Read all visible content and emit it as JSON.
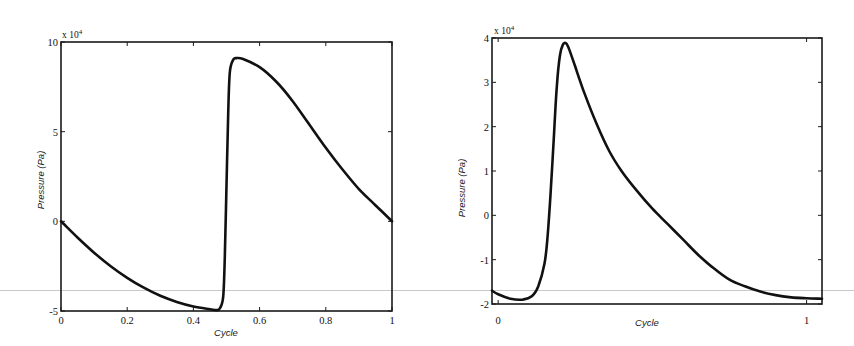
{
  "chart_data": [
    {
      "type": "line",
      "title": "",
      "xlabel": "Cycle",
      "ylabel": "Pressure (Pa)",
      "y_multiplier": "x 10^4",
      "xlim": [
        0,
        1
      ],
      "ylim": [
        -5,
        10
      ],
      "xticks": [
        0,
        0.2,
        0.4,
        0.6,
        0.8,
        1
      ],
      "xtick_labels": [
        "0",
        "0.2",
        "0.4",
        "0.6",
        "0.8",
        "1"
      ],
      "yticks": [
        -5,
        0,
        5,
        10
      ],
      "ytick_labels": [
        "-5",
        "0",
        "5",
        "10"
      ],
      "grid": false,
      "legend": null,
      "series": [
        {
          "name": "pressure",
          "x": [
            0,
            0.05,
            0.1,
            0.15,
            0.2,
            0.25,
            0.3,
            0.35,
            0.4,
            0.45,
            0.47,
            0.48,
            0.49,
            0.495,
            0.5,
            0.505,
            0.51,
            0.52,
            0.53,
            0.55,
            0.6,
            0.65,
            0.7,
            0.75,
            0.8,
            0.85,
            0.9,
            0.95,
            1.0
          ],
          "y": [
            0,
            -0.9,
            -1.75,
            -2.5,
            -3.15,
            -3.7,
            -4.15,
            -4.5,
            -4.75,
            -4.9,
            -4.95,
            -4.85,
            -4.2,
            -2.0,
            2.0,
            6.0,
            8.3,
            9.0,
            9.1,
            9.05,
            8.6,
            7.8,
            6.7,
            5.4,
            4.1,
            2.9,
            1.8,
            0.9,
            0.0
          ]
        }
      ]
    },
    {
      "type": "line",
      "title": "",
      "xlabel": "Cycle",
      "ylabel": "Pressure (Pa)",
      "y_multiplier": "x 10^4",
      "xlim": [
        -0.02,
        1.05
      ],
      "ylim": [
        -2,
        4
      ],
      "xticks": [
        0,
        1
      ],
      "xtick_labels": [
        "0",
        "1"
      ],
      "yticks": [
        -2,
        -1,
        0,
        1,
        2,
        3,
        4
      ],
      "ytick_labels": [
        "-2",
        "-1",
        "0",
        "1",
        "2",
        "3",
        "4"
      ],
      "grid": false,
      "legend": null,
      "series": [
        {
          "name": "pressure",
          "x": [
            -0.02,
            0.0,
            0.04,
            0.08,
            0.11,
            0.13,
            0.15,
            0.16,
            0.17,
            0.18,
            0.19,
            0.2,
            0.21,
            0.22,
            0.23,
            0.25,
            0.28,
            0.32,
            0.36,
            0.4,
            0.45,
            0.5,
            0.55,
            0.6,
            0.65,
            0.7,
            0.75,
            0.8,
            0.85,
            0.9,
            0.95,
            1.0,
            1.05
          ],
          "y": [
            -1.7,
            -1.78,
            -1.88,
            -1.9,
            -1.82,
            -1.6,
            -1.1,
            -0.5,
            0.5,
            1.7,
            2.9,
            3.6,
            3.85,
            3.88,
            3.75,
            3.35,
            2.75,
            2.05,
            1.45,
            1.0,
            0.55,
            0.15,
            -0.2,
            -0.55,
            -0.9,
            -1.2,
            -1.45,
            -1.6,
            -1.72,
            -1.8,
            -1.85,
            -1.87,
            -1.88
          ]
        }
      ]
    }
  ],
  "charts": {
    "left": {
      "exponent_label": "x 10",
      "exponent_power": "4",
      "xlabel": "Cycle",
      "ylabel": "Pressure (Pa)",
      "xtick_labels": [
        "0",
        "0.2",
        "0.4",
        "0.6",
        "0.8",
        "1"
      ],
      "ytick_labels": [
        "-5",
        "0",
        "5",
        "10"
      ]
    },
    "right": {
      "exponent_label": "x 10",
      "exponent_power": "4",
      "xlabel": "Cycle",
      "ylabel": "Pressure (Pa)",
      "xtick_labels": [
        "0",
        "1"
      ],
      "ytick_labels": [
        "-2",
        "-1",
        "0",
        "1",
        "2",
        "3",
        "4"
      ]
    }
  },
  "colors": {
    "line": "#111111",
    "axes": "#1a1a1a",
    "background": "#ffffff"
  }
}
